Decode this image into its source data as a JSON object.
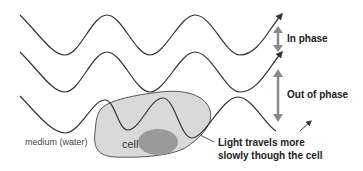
{
  "labels": {
    "in_phase": "In phase",
    "out_of_phase": "Out of  phase",
    "medium": "medium (water)",
    "cell": "cell",
    "light_line1": "Light travels more",
    "light_line2": "slowly though the cell"
  },
  "colors": {
    "wave": "#333333",
    "cell_fill": "#d9d9d9",
    "cell_stroke": "#555555",
    "nucleus_fill": "#9a9a9a",
    "phase_arrow": "#8a8a8a"
  }
}
